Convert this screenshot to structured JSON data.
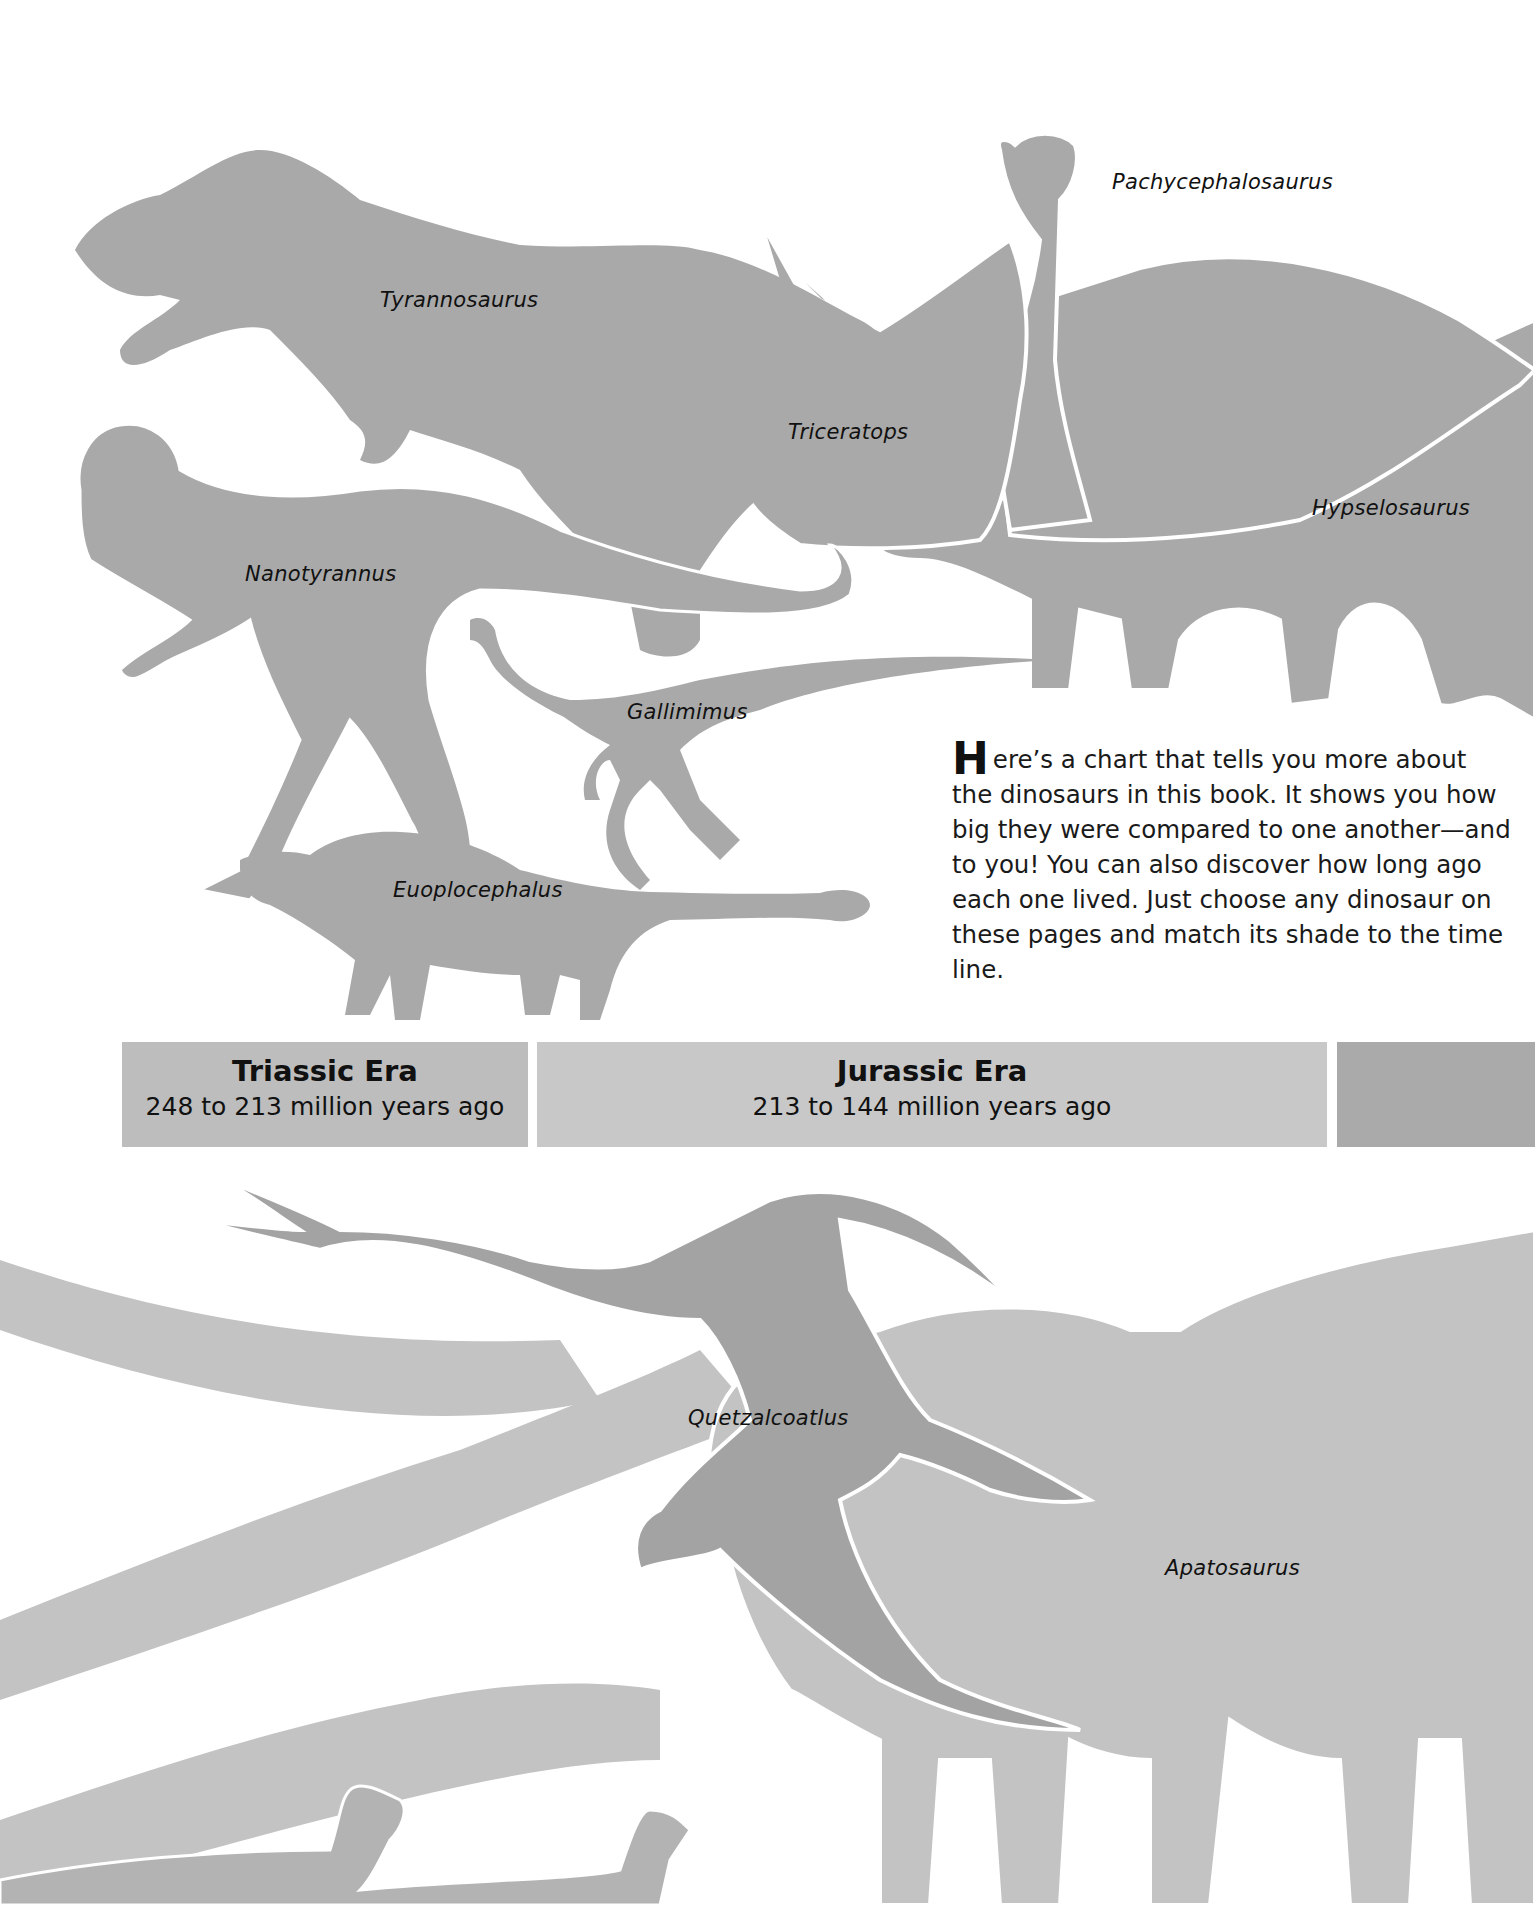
{
  "intro": {
    "dropcap": "H",
    "text": "ere’s a chart that tells you more about the dinosaurs in this book. It shows you how big they were compared to one another—and to you! You can also discover how long ago each one lived. Just choose any dinosaur on these pages and match its shade to the time line."
  },
  "eras": [
    {
      "name": "Triassic Era",
      "range": "248 to 213 million years ago",
      "color": "#bdbdbd"
    },
    {
      "name": "Jurassic Era",
      "range": "213 to 144 million years ago",
      "color": "#c8c8c8"
    },
    {
      "name": "",
      "range": "",
      "color": "#aaaaaa"
    }
  ],
  "dinosaurs": [
    {
      "name": "Tyrannosaurus"
    },
    {
      "name": "Pachycephalosaurus"
    },
    {
      "name": "Triceratops"
    },
    {
      "name": "Hypselosaurus"
    },
    {
      "name": "Nanotyrannus"
    },
    {
      "name": "Gallimimus"
    },
    {
      "name": "Euoplocephalus"
    },
    {
      "name": "Quetzalcoatlus"
    },
    {
      "name": "Apatosaurus"
    }
  ],
  "colors": {
    "cretaceous_silhouette": "#a9a9a9",
    "jurassic_silhouette": "#c3c3c3",
    "pterosaur_silhouette": "#a3a3a3",
    "outline": "#ffffff"
  }
}
